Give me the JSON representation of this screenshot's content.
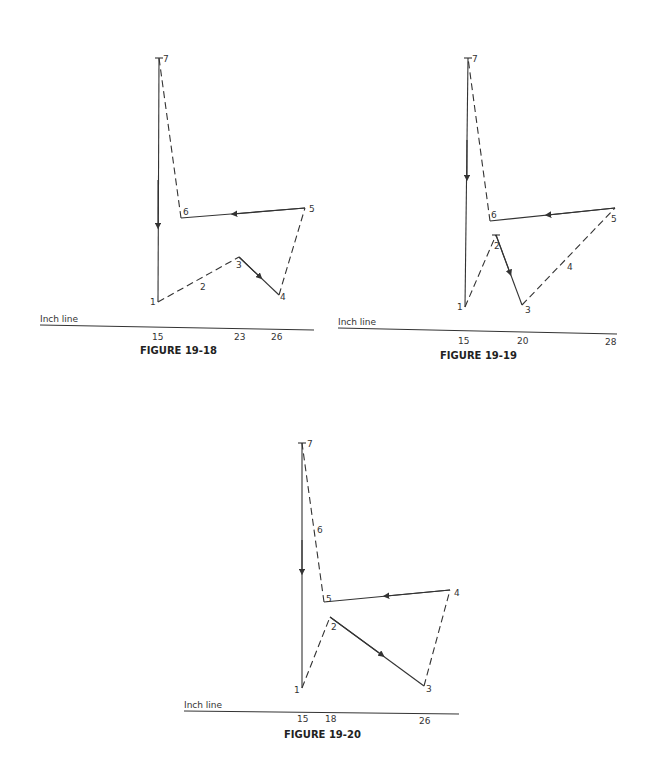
{
  "figures": [
    {
      "caption": "FIGURE 19-18",
      "inch_line_label": "Inch line",
      "ticks": [
        "15",
        "23",
        "26"
      ],
      "points": {
        "1": "1",
        "2": "2",
        "3": "3",
        "4": "4",
        "5": "5",
        "6": "6",
        "7": "7"
      }
    },
    {
      "caption": "FIGURE 19-19",
      "inch_line_label": "Inch line",
      "ticks": [
        "15",
        "20",
        "28"
      ],
      "points": {
        "1": "1",
        "2": "2",
        "3": "3",
        "4": "4",
        "5": "5",
        "6": "6",
        "7": "7"
      }
    },
    {
      "caption": "FIGURE 19-20",
      "inch_line_label": "Inch line",
      "ticks": [
        "15",
        "18",
        "26"
      ],
      "points": {
        "1": "1",
        "2": "2",
        "3": "3",
        "4": "4",
        "5": "5",
        "6": "6",
        "7": "7"
      }
    }
  ]
}
